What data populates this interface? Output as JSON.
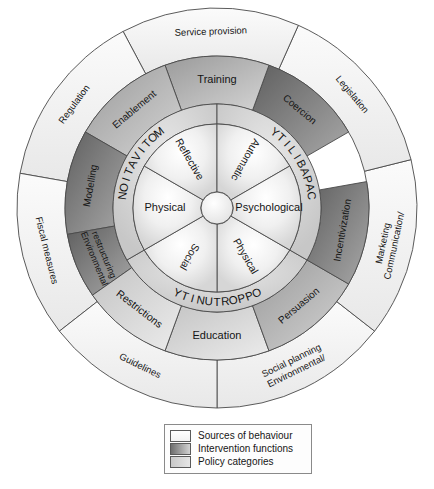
{
  "diagram": {
    "center": {
      "cx": 217,
      "cy": 208
    },
    "radii": {
      "hub": 16,
      "inner_sources_outer": 84,
      "com_band_outer": 104,
      "intervention_outer": 152,
      "policy_outer": 200
    },
    "colors": {
      "sources_fill": "#e9e9e9",
      "sources_fill_light": "#fbfbfb",
      "com_band_fill": "#d8d8d8",
      "intervention_fill_dark": "#6d6d6d",
      "intervention_fill_light": "#cfcfcf",
      "policy_fill": "#f4f4f4",
      "policy_fill_shade": "#e2e2e2",
      "stroke": "#4a4a4a",
      "text": "#141414",
      "background": "#ffffff"
    }
  },
  "chart_data": {
    "type": "pie",
    "rings": [
      {
        "name": "sources-of-behaviour",
        "ring_index": 0,
        "segment_count": 6,
        "labels": [
          "Physical",
          "Social",
          "Physical",
          "Reflective",
          "Automatic",
          "Psychological"
        ]
      },
      {
        "name": "com-b-groups",
        "ring_index": 1,
        "segment_count": 3,
        "labels": [
          "OPPORTUNITY",
          "MOTIVATION",
          "CAPABILITY"
        ]
      },
      {
        "name": "intervention-functions",
        "ring_index": 2,
        "segment_count": 9,
        "labels": [
          "Education",
          "Persuasion",
          "Incentivization",
          "Coercion",
          "Training",
          "Enablement",
          "Modelling",
          "Environmental restructuring",
          "Restrictions"
        ]
      },
      {
        "name": "policy-categories",
        "ring_index": 3,
        "segment_count": 7,
        "labels": [
          "Environmental/Social planning",
          "Communication/Marketing",
          "Legislation",
          "Service provision",
          "Regulation",
          "Fiscal measures",
          "Guidelines"
        ]
      }
    ]
  },
  "sources_ring": {
    "name": "Sources of behaviour",
    "segments": [
      {
        "label": "Physical",
        "mid_deg": 300,
        "size_deg": 60,
        "text_mode": "radial"
      },
      {
        "label": "Social",
        "mid_deg": 240,
        "size_deg": 60,
        "text_mode": "radial"
      },
      {
        "label": "Physical",
        "mid_deg": 180,
        "size_deg": 60,
        "text_mode": "horizontal"
      },
      {
        "label": "Reflective",
        "mid_deg": 120,
        "size_deg": 60,
        "text_mode": "radial"
      },
      {
        "label": "Automatic",
        "mid_deg": 60,
        "size_deg": 60,
        "text_mode": "radial"
      },
      {
        "label": "Psychological",
        "mid_deg": 0,
        "size_deg": 60,
        "text_mode": "horizontal"
      }
    ]
  },
  "com_ring": {
    "name": "COM-B components",
    "segments": [
      {
        "label": "OPPORTUNITY",
        "start_deg": 210,
        "end_deg": 330,
        "font_size": 11.5
      },
      {
        "label": "MOTIVATION",
        "start_deg": 90,
        "end_deg": 210,
        "font_size": 11.5
      },
      {
        "label": "CAPABILITY",
        "start_deg": 330,
        "end_deg": 450,
        "font_size": 11.5
      }
    ]
  },
  "intervention_ring": {
    "name": "Intervention functions",
    "segments": [
      {
        "label": "Education",
        "start_deg": 250,
        "end_deg": 290,
        "tone": "light",
        "font_size": 11
      },
      {
        "label": "Persuasion",
        "start_deg": 290,
        "end_deg": 330,
        "tone": "mid",
        "font_size": 10
      },
      {
        "label": "Incentivization",
        "start_deg": 330,
        "end_deg": 370,
        "tone": "dark",
        "font_size": 10
      },
      {
        "label": "Coercion",
        "start_deg": 30,
        "end_deg": 70,
        "tone": "dark",
        "font_size": 10
      },
      {
        "label": "Training",
        "start_deg": 70,
        "end_deg": 110,
        "tone": "mid",
        "font_size": 11
      },
      {
        "label": "Enablement",
        "start_deg": 110,
        "end_deg": 150,
        "tone": "mid",
        "font_size": 10
      },
      {
        "label": "Modelling",
        "start_deg": 150,
        "end_deg": 190,
        "tone": "dark",
        "font_size": 10
      },
      {
        "label": "Environmental restructuring",
        "start_deg": 190,
        "end_deg": 215,
        "tone": "dark",
        "font_size": 9,
        "two_line": true
      },
      {
        "label": "Restrictions",
        "start_deg": 215,
        "end_deg": 250,
        "tone": "light",
        "font_size": 10.5
      }
    ]
  },
  "policy_ring": {
    "name": "Policy categories",
    "segments": [
      {
        "label": "Environmental/Social planning",
        "start_deg": 270,
        "end_deg": 322,
        "font_size": 9.5,
        "two_line": true
      },
      {
        "label": "Communication/Marketing",
        "start_deg": 322,
        "end_deg": 374,
        "font_size": 9.5,
        "two_line": true
      },
      {
        "label": "Legislation",
        "start_deg": 14,
        "end_deg": 66,
        "font_size": 9.5
      },
      {
        "label": "Service provision",
        "start_deg": 66,
        "end_deg": 118,
        "font_size": 9.5
      },
      {
        "label": "Regulation",
        "start_deg": 118,
        "end_deg": 170,
        "font_size": 9.5
      },
      {
        "label": "Fiscal measures",
        "start_deg": 170,
        "end_deg": 218,
        "font_size": 9.5
      },
      {
        "label": "Guidelines",
        "start_deg": 218,
        "end_deg": 270,
        "font_size": 9.5
      }
    ]
  },
  "legend": {
    "items": [
      {
        "label": "Sources of behaviour",
        "swatch": "sw-sources"
      },
      {
        "label": "Intervention functions",
        "swatch": "sw-interventions"
      },
      {
        "label": "Policy categories",
        "swatch": "sw-policy"
      }
    ]
  }
}
